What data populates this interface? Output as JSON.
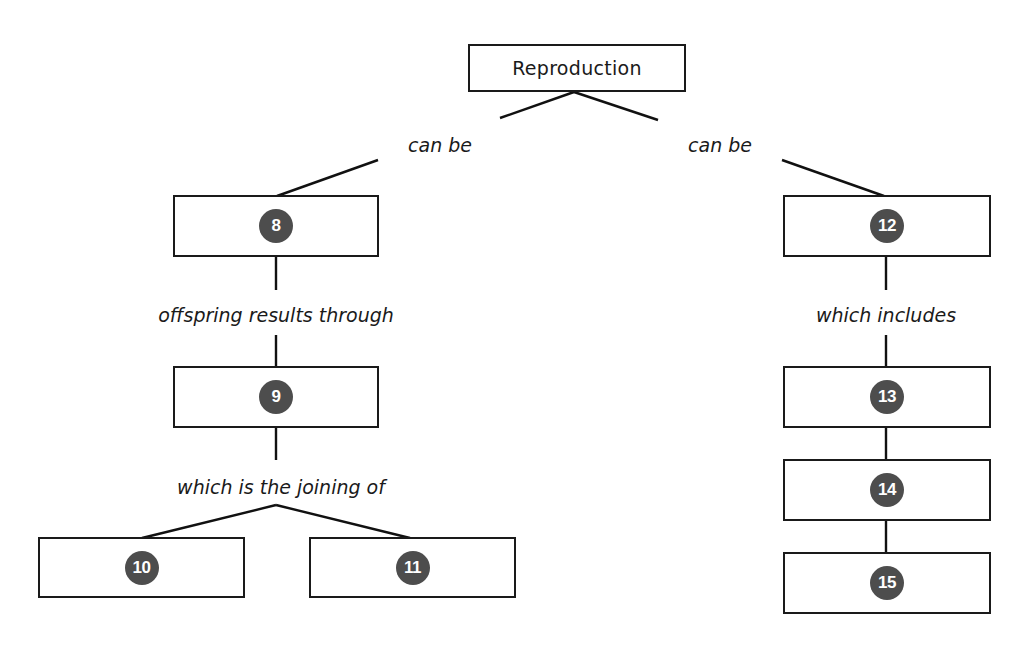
{
  "diagram": {
    "root": {
      "label": "Reproduction"
    },
    "links": {
      "left_can_be": "can be",
      "right_can_be": "can be",
      "offspring": "offspring results through",
      "joining": "which is the joining of",
      "includes": "which includes"
    },
    "nodes": {
      "n8": "8",
      "n9": "9",
      "n10": "10",
      "n11": "11",
      "n12": "12",
      "n13": "13",
      "n14": "14",
      "n15": "15"
    },
    "colors": {
      "badge": "#4d4d4d",
      "stroke": "#111111"
    }
  }
}
